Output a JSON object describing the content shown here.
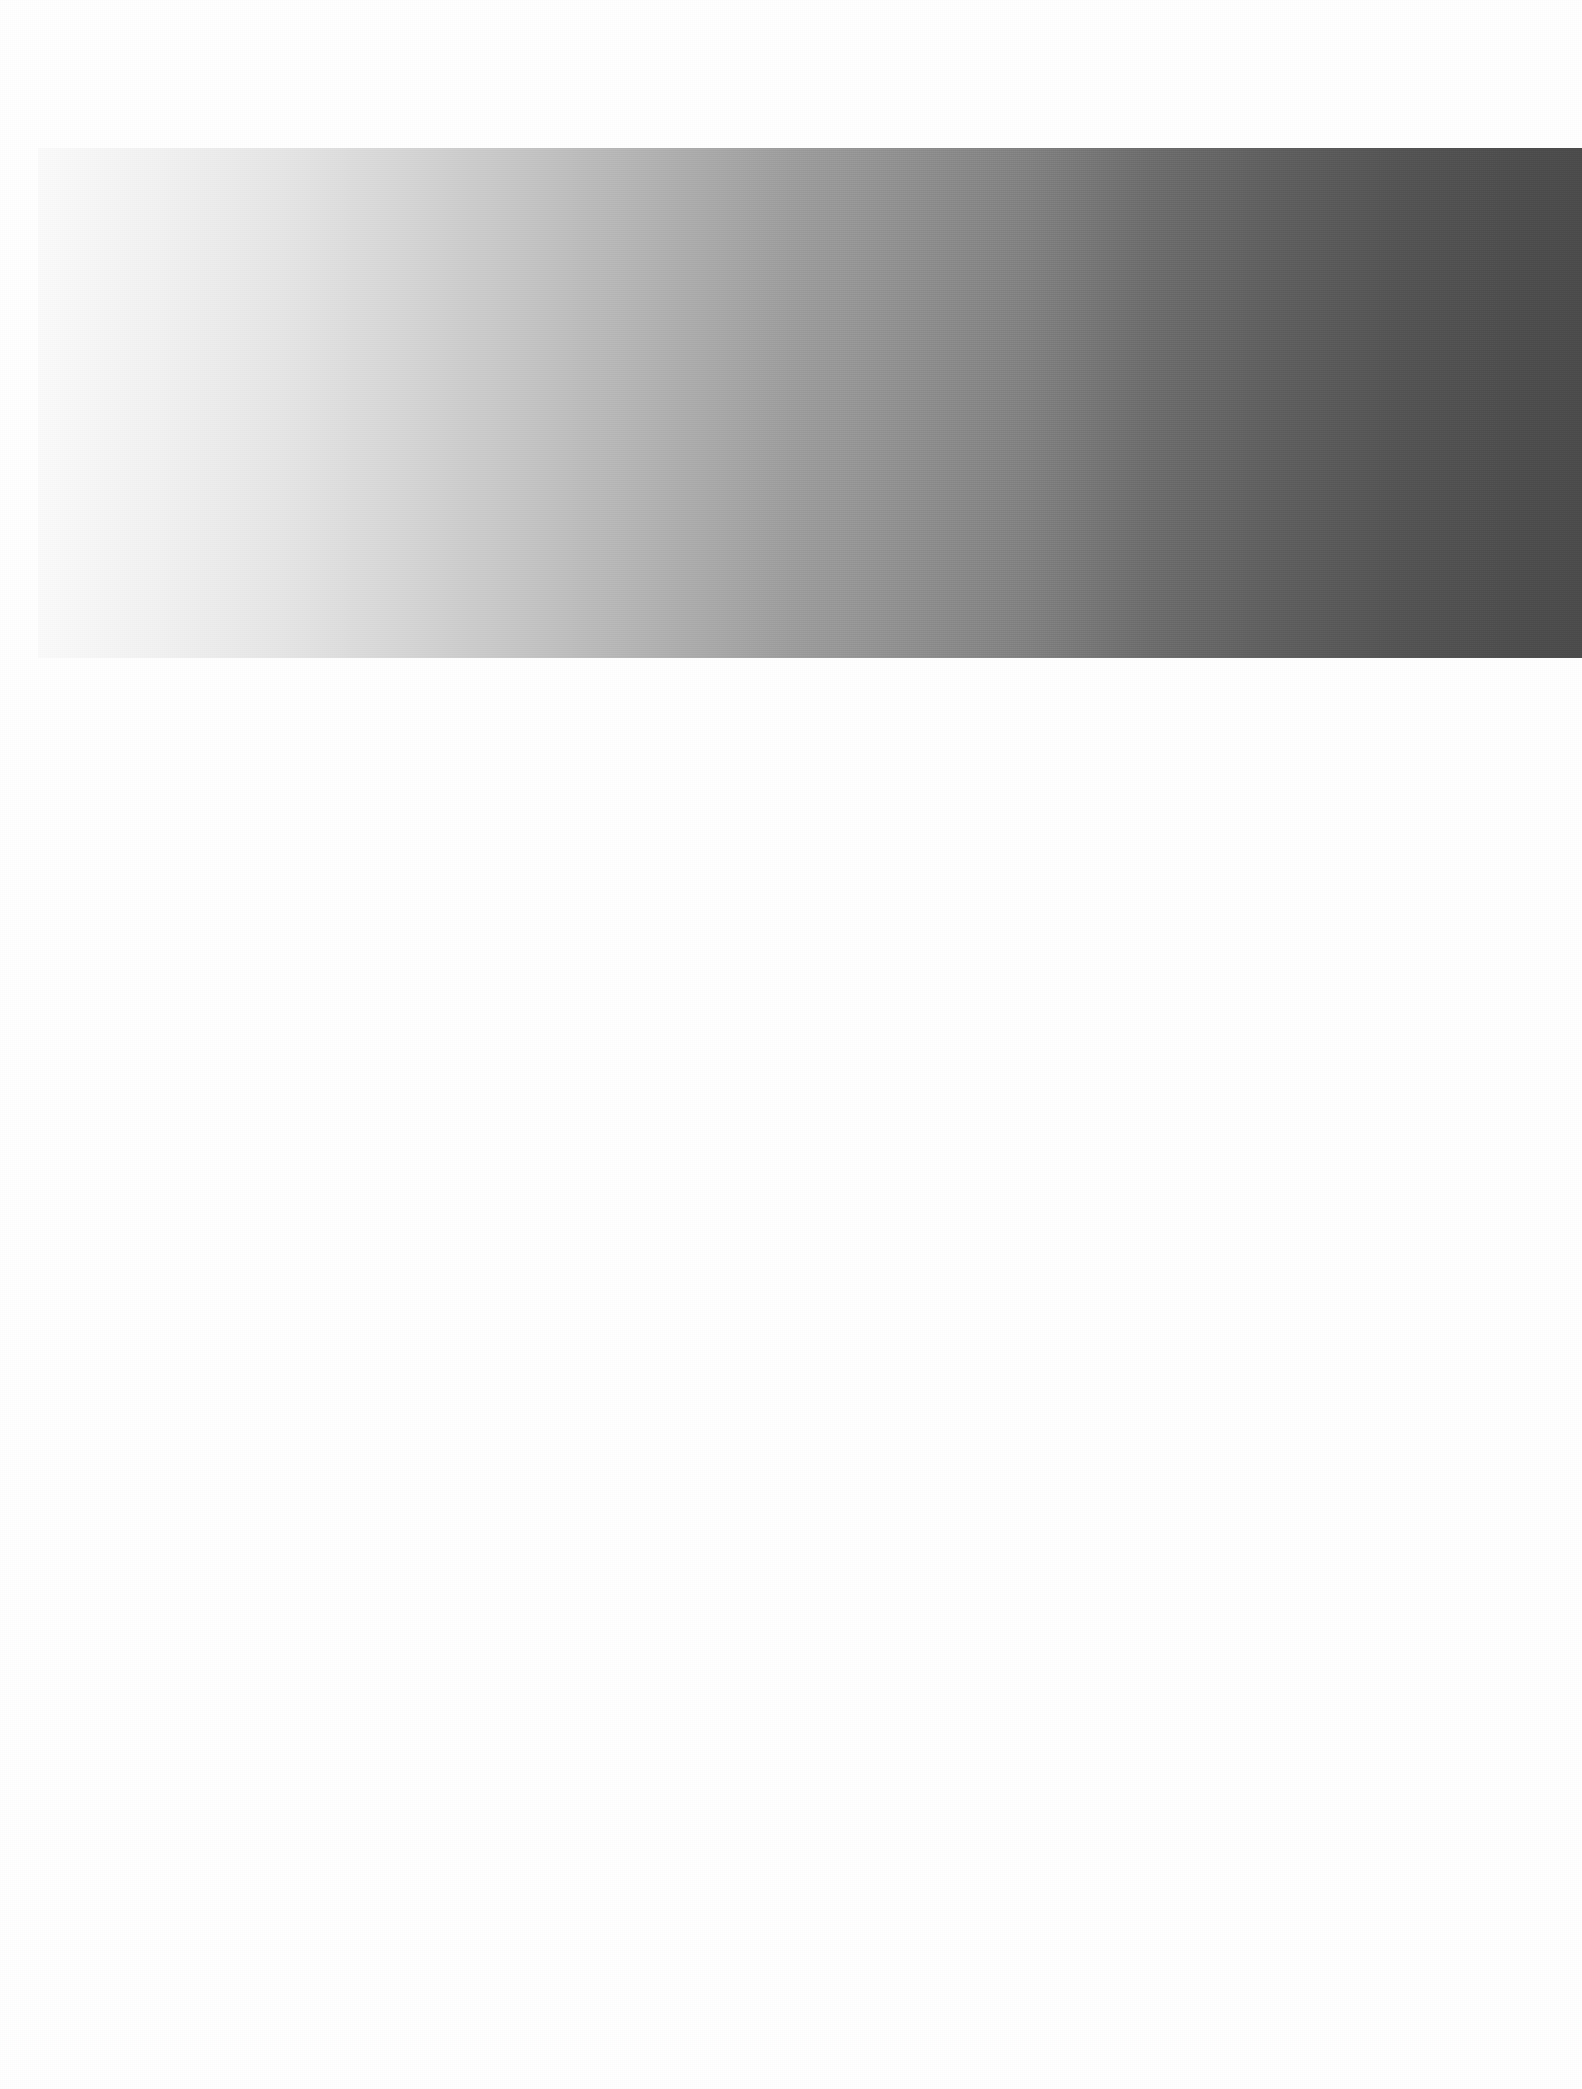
{
  "page": {
    "width_px": 1582,
    "height_px": 2089,
    "background_color": "#ffffff",
    "has_text": false,
    "has_controls": false
  },
  "chart_data": {
    "type": "heatmap",
    "title": "",
    "subtitle": "",
    "xlabel": "",
    "ylabel": "",
    "grid": false,
    "legend_position": "none",
    "annotations": [],
    "tick_labels_x": [],
    "tick_labels_y": [],
    "orientation": "horizontal",
    "band": {
      "left_px": 38,
      "top_px": 148,
      "width_px": 1544,
      "height_px": 510,
      "right_px": 1582,
      "bottom_px": 658
    },
    "gradient": {
      "direction": "left-to-right",
      "angle_deg": 90,
      "stops": [
        {
          "position_pct": 0,
          "color": "#fbfbfb",
          "gray_value": 251
        },
        {
          "position_pct": 8,
          "color": "#f2f2f2",
          "gray_value": 242
        },
        {
          "position_pct": 16,
          "color": "#e6e6e6",
          "gray_value": 230
        },
        {
          "position_pct": 24,
          "color": "#d6d6d6",
          "gray_value": 214
        },
        {
          "position_pct": 32,
          "color": "#c4c4c4",
          "gray_value": 196
        },
        {
          "position_pct": 40,
          "color": "#b2b2b2",
          "gray_value": 178
        },
        {
          "position_pct": 48,
          "color": "#9f9f9f",
          "gray_value": 159
        },
        {
          "position_pct": 56,
          "color": "#909090",
          "gray_value": 144
        },
        {
          "position_pct": 64,
          "color": "#818181",
          "gray_value": 129
        },
        {
          "position_pct": 72,
          "color": "#6d6d6d",
          "gray_value": 109
        },
        {
          "position_pct": 80,
          "color": "#5f5f5f",
          "gray_value": 95
        },
        {
          "position_pct": 88,
          "color": "#545454",
          "gray_value": 84
        },
        {
          "position_pct": 96,
          "color": "#4d4d4d",
          "gray_value": 77
        },
        {
          "position_pct": 100,
          "color": "#4b4b4b",
          "gray_value": 75
        }
      ]
    },
    "x": [
      0,
      8,
      16,
      24,
      32,
      40,
      48,
      56,
      64,
      72,
      80,
      88,
      96,
      100
    ],
    "values": [
      251,
      242,
      230,
      214,
      196,
      178,
      159,
      144,
      129,
      109,
      95,
      84,
      77,
      75
    ],
    "ylim": [
      0,
      255
    ],
    "xlim": [
      0,
      100
    ]
  }
}
